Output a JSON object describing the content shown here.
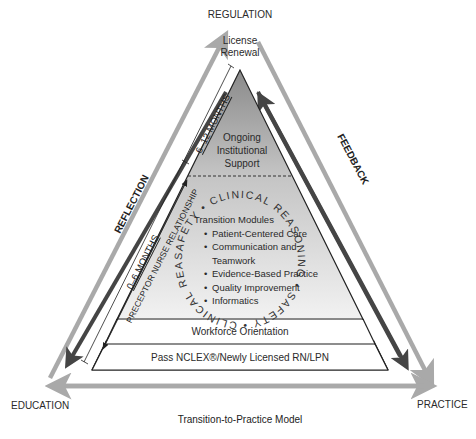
{
  "diagram": {
    "title": "Transition-to-Practice Model",
    "corners": {
      "top": "REGULATION",
      "left": "EDUCATION",
      "right": "PRACTICE"
    },
    "side_labels": {
      "left": "REFLECTION",
      "right": "FEEDBACK"
    },
    "timeline": {
      "early": "0–6 MONTHS",
      "late": "6–12 MONTHS",
      "relationship": "PRECEPTOR NURSE RELATIONSHIP"
    },
    "pyramid": {
      "apex": {
        "line1": "License",
        "line2": "Renewal"
      },
      "support": {
        "line1": "Ongoing",
        "line2": "Institutional",
        "line3": "Support"
      },
      "modules": {
        "heading": "Transition Modules",
        "items": [
          "Patient-Centered Care",
          "Communication and",
          "Teamwork",
          "Evidence-Based Practice",
          "Quality Improvement",
          "Informatics"
        ]
      },
      "ring_text": "SAFETY • CLINICAL REASONING • SAFETY • CLINICAL REASONING •",
      "orientation": "Workforce Orientation",
      "base": "Pass NCLEX®/Newly Licensed RN/LPN"
    },
    "colors": {
      "outer_arrow": "#a9a9a9",
      "inner_arrow": "#4a4a4a",
      "gradient_top": "#8c8c8c",
      "gradient_bottom": "#f2f2f2",
      "line": "#222222",
      "text": "#2a2a2a"
    }
  }
}
